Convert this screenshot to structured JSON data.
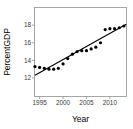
{
  "chart_data": {
    "type": "scatter",
    "title": "",
    "xlabel": "Year",
    "ylabel": "PercentGDP",
    "x": [
      1994,
      1995,
      1996,
      1997,
      1998,
      1999,
      2000,
      2001,
      2002,
      2003,
      2004,
      2005,
      2006,
      2007,
      2008,
      2009,
      2010,
      2011,
      2012,
      2013
    ],
    "y": [
      13.3,
      13.2,
      13.1,
      13.0,
      13.0,
      13.1,
      13.6,
      14.2,
      14.7,
      15.0,
      15.1,
      15.1,
      15.3,
      15.5,
      16.0,
      17.5,
      17.6,
      17.6,
      17.7,
      17.9
    ],
    "trendline": {
      "x1": 1994.0,
      "y1": 12.3,
      "x2": 2013.5,
      "y2": 18.1
    },
    "xticks": [
      1995,
      2000,
      2005,
      2010
    ],
    "yticks": [
      12,
      14,
      16,
      18
    ],
    "xlim": [
      1993.9,
      2013.55
    ],
    "ylim": [
      9.9,
      20.0
    ],
    "grid": "off",
    "legend": "none",
    "point_color": "#000000",
    "trend_color": "#000000",
    "frame_color": "#909090",
    "tick_color": "#909090",
    "tick_label_color": "#3a3a3a",
    "background": "#ffffff"
  }
}
